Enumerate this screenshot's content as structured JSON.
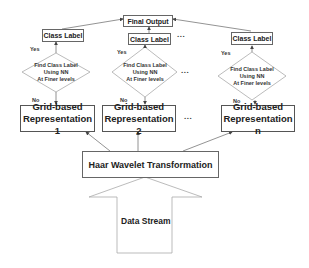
{
  "diagram": {
    "final_output": "Final Output",
    "columns": [
      {
        "class_label": "Class Label",
        "decision": [
          "Find Class Label",
          "Using NN",
          "At Finer levels"
        ],
        "yes": "Yes",
        "no": "No",
        "grid": [
          "Grid-based",
          "Representation 1"
        ]
      },
      {
        "class_label": "Class Label",
        "decision": [
          "Find Class Label",
          "Using NN",
          "At Finer levels"
        ],
        "yes": "Yes",
        "no": "No",
        "grid": [
          "Grid-based",
          "Representation 2"
        ]
      },
      {
        "class_label": "Class Label",
        "decision": [
          "Find Class Label",
          "Using NN",
          "At Finer levels"
        ],
        "yes": "Yes",
        "no": "No",
        "grid": [
          "Grid-based",
          "Representation n"
        ]
      }
    ],
    "ellipsis": "...",
    "transform": "Haar Wavelet Transformation",
    "input": "Data Stream",
    "colors": {
      "stroke": "#666666",
      "text": "#222222",
      "background": "#ffffff"
    }
  }
}
